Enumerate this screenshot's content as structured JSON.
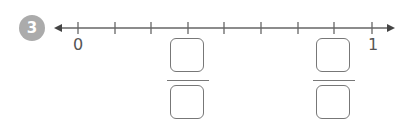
{
  "question": {
    "number": "3"
  },
  "number_line": {
    "start_label": "0",
    "end_label": "1",
    "intervals": 8,
    "tick_count": 9,
    "line_color": "#666666"
  },
  "answer_boxes": [
    {
      "position_tick": 3,
      "numerator": "",
      "denominator": ""
    },
    {
      "position_tick": 7,
      "numerator": "",
      "denominator": ""
    }
  ]
}
